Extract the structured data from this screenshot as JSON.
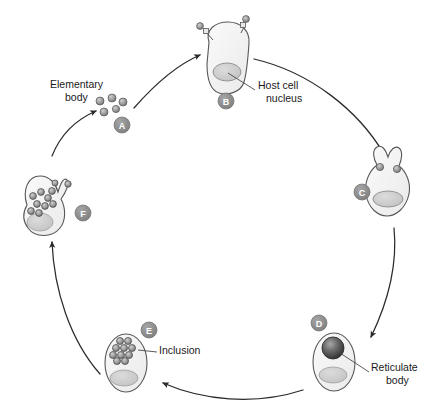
{
  "diagram": {
    "background_color": "#ffffff",
    "stroke_color": "#3a3a3a",
    "stage_marker_fill": "#8c8c8c",
    "stage_marker_text_color": "#ffffff",
    "cell_fill": "#f2f2f2",
    "cell_stroke": "#555555",
    "nucleus_fill": "#cfcfcf",
    "particle_fill": "#9a9a9a",
    "reticulate_body_fill": "#4a4a4a"
  },
  "stages": [
    {
      "id": "A",
      "letter": "A",
      "name": "elementary-bodies-free",
      "marker_x": 122,
      "marker_y": 125,
      "description": "Free elementary bodies approaching host cell"
    },
    {
      "id": "B",
      "letter": "B",
      "name": "attachment-to-host-cell",
      "marker_x": 226,
      "marker_y": 101,
      "description": "Elementary bodies attach to host cell surface"
    },
    {
      "id": "C",
      "letter": "C",
      "name": "endocytosis-uptake",
      "marker_x": 362,
      "marker_y": 192,
      "description": "Host cell engulfs elementary bodies by endocytosis"
    },
    {
      "id": "D",
      "letter": "D",
      "name": "reticulate-body-formation",
      "marker_x": 319,
      "marker_y": 323,
      "description": "Elementary body converts to reticulate body"
    },
    {
      "id": "E",
      "letter": "E",
      "name": "inclusion-multiplication",
      "marker_x": 149,
      "marker_y": 330,
      "description": "Reticulate bodies multiply within inclusion"
    },
    {
      "id": "F",
      "letter": "F",
      "name": "cell-lysis-release",
      "marker_x": 83,
      "marker_y": 213,
      "description": "Host cell lyses and releases elementary bodies"
    }
  ],
  "labels": [
    {
      "id": "elementary-body",
      "name": "elementary-body-label",
      "lines": [
        "Elementary",
        "body"
      ],
      "x": 50,
      "y": 88,
      "anchor": "start"
    },
    {
      "id": "host-cell-nucleus",
      "name": "host-cell-nucleus-label",
      "lines": [
        "Host cell",
        "nucleus"
      ],
      "x": 258,
      "y": 89,
      "anchor": "start"
    },
    {
      "id": "inclusion",
      "name": "inclusion-label",
      "lines": [
        "Inclusion"
      ],
      "x": 159,
      "y": 354,
      "anchor": "start"
    },
    {
      "id": "reticulate-body",
      "name": "reticulate-body-label",
      "lines": [
        "Reticulate",
        "body"
      ],
      "x": 371,
      "y": 371,
      "anchor": "start"
    }
  ],
  "arrows": [
    {
      "id": "a-to-b",
      "name": "arrow-a-to-b",
      "from": "A",
      "to": "B"
    },
    {
      "id": "b-to-c",
      "name": "arrow-b-to-c",
      "from": "B",
      "to": "C"
    },
    {
      "id": "c-to-d",
      "name": "arrow-c-to-d",
      "from": "C",
      "to": "D"
    },
    {
      "id": "d-to-e",
      "name": "arrow-d-to-e",
      "from": "D",
      "to": "E"
    },
    {
      "id": "e-to-f",
      "name": "arrow-e-to-f",
      "from": "E",
      "to": "F"
    },
    {
      "id": "f-to-a",
      "name": "arrow-f-to-a",
      "from": "F",
      "to": "A"
    }
  ]
}
